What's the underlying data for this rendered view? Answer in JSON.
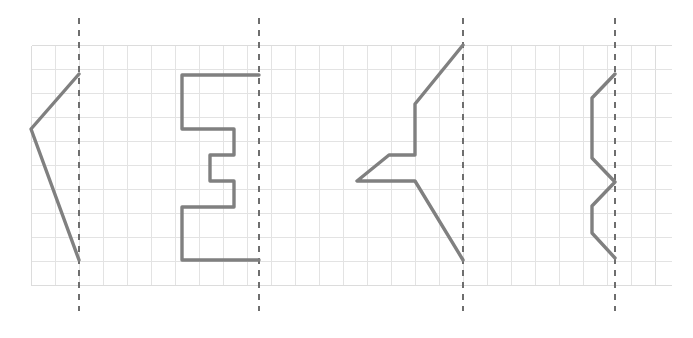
{
  "page": {
    "background_color": "#ffffff",
    "width": 693,
    "height": 338
  },
  "grid": {
    "name": "square-grid",
    "cell_size": 24,
    "x_start": 31,
    "y_start": 45,
    "x_end": 671,
    "y_end": 285,
    "columns": 26,
    "rows": 10,
    "line_color": "#e3e3e3",
    "border_color": "#dcdcdc"
  },
  "mirror_lines": [
    {
      "name": "mirror-line-1",
      "label": "Line of symmetry 1",
      "x": 79,
      "y_top": 18,
      "y_bottom": 311,
      "orientation": "vertical",
      "color": "#6e6e6e",
      "dash": "6 6"
    },
    {
      "name": "mirror-line-2",
      "label": "Line of symmetry 2",
      "x": 259,
      "y_top": 18,
      "y_bottom": 311,
      "orientation": "vertical",
      "color": "#6e6e6e",
      "dash": "6 6"
    },
    {
      "name": "mirror-line-3",
      "label": "Line of symmetry 3",
      "x": 463,
      "y_top": 18,
      "y_bottom": 311,
      "orientation": "vertical",
      "color": "#6e6e6e",
      "dash": "6 6"
    },
    {
      "name": "mirror-line-4",
      "label": "Line of symmetry 4",
      "x": 615,
      "y_top": 18,
      "y_bottom": 311,
      "orientation": "vertical",
      "color": "#6e6e6e",
      "dash": "6 6"
    }
  ],
  "figures": [
    {
      "name": "figure-1-chevron",
      "label": "Chevron half-shape",
      "stroke_color": "#808080",
      "stroke_width": 3.4,
      "closed": false,
      "points": "79,74 31,129 79,260",
      "vertices": [
        [
          79,
          74
        ],
        [
          31,
          129
        ],
        [
          79,
          260
        ]
      ]
    },
    {
      "name": "figure-2-staircase",
      "label": "Staircase half-shape",
      "stroke_color": "#808080",
      "stroke_width": 3.4,
      "closed": false,
      "points": "259,75 182,75 182,129 234,129 234,155 210,155 210,181 234,181 234,207 182,207 182,260 259,260",
      "vertices": [
        [
          259,
          75
        ],
        [
          182,
          75
        ],
        [
          182,
          129
        ],
        [
          234,
          129
        ],
        [
          234,
          155
        ],
        [
          210,
          155
        ],
        [
          210,
          181
        ],
        [
          234,
          181
        ],
        [
          234,
          207
        ],
        [
          182,
          207
        ],
        [
          182,
          260
        ],
        [
          259,
          260
        ]
      ]
    },
    {
      "name": "figure-3-arrow",
      "label": "Arrow half-shape",
      "stroke_color": "#808080",
      "stroke_width": 3.4,
      "closed": false,
      "points": "463,45 415,104 415,155 389,155 357,181 415,181 463,260",
      "vertices": [
        [
          463,
          45
        ],
        [
          415,
          104
        ],
        [
          415,
          155
        ],
        [
          389,
          155
        ],
        [
          357,
          181
        ],
        [
          415,
          181
        ],
        [
          463,
          260
        ]
      ]
    },
    {
      "name": "figure-4-zigzag",
      "label": "Zigzag half-shape",
      "stroke_color": "#808080",
      "stroke_width": 3.4,
      "closed": false,
      "points": "615,74 592,98 592,158 615,182 592,206 592,233 615,258",
      "vertices": [
        [
          615,
          74
        ],
        [
          592,
          98
        ],
        [
          592,
          158
        ],
        [
          615,
          182
        ],
        [
          592,
          206
        ],
        [
          592,
          233
        ],
        [
          615,
          258
        ]
      ]
    }
  ]
}
